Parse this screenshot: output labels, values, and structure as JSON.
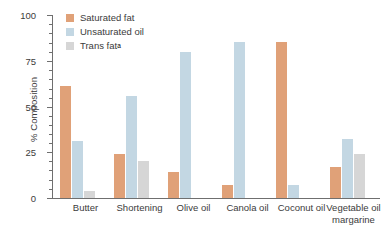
{
  "chart_data": {
    "type": "bar",
    "title": "",
    "xlabel": "",
    "ylabel": "% Composition",
    "ylim": [
      0,
      100
    ],
    "yticks": [
      0,
      25,
      50,
      75,
      100
    ],
    "ytick_labels": [
      "0",
      "25",
      "50",
      "75",
      "100"
    ],
    "minor_ticks_per_interval": 4,
    "grid": false,
    "legend_position": "top-left-inside",
    "categories": [
      "Butter",
      "Shortening",
      "Olive oil",
      "Canola oil",
      "Coconut oil",
      "Vegetable oil margarine"
    ],
    "series": [
      {
        "name": "Saturated fat",
        "color": "#e0a178",
        "values": [
          61,
          24,
          14,
          7,
          85,
          17
        ]
      },
      {
        "name": "Unsaturated oil",
        "color": "#c3d7e3",
        "values": [
          31,
          56,
          80,
          85,
          7,
          32
        ]
      },
      {
        "name": "Trans fat",
        "color": "#d6d6d6",
        "values": [
          4,
          20,
          0,
          0,
          0,
          24
        ]
      }
    ],
    "annotations": {
      "trans_fat_footnote_marker": "a"
    }
  },
  "axis": {
    "y_title": "% Composition",
    "y_tick_0": "0",
    "y_tick_25": "25",
    "y_tick_50": "50",
    "y_tick_75": "75",
    "y_tick_100": "100"
  },
  "legend": {
    "items": [
      {
        "label": "Saturated fat",
        "color": "#e0a178",
        "marker": ""
      },
      {
        "label": "Unsaturated oil",
        "color": "#c3d7e3",
        "marker": ""
      },
      {
        "label": "Trans fat",
        "color": "#d6d6d6",
        "marker": "a"
      }
    ]
  },
  "categories": {
    "c0_line1": "Butter",
    "c0_line2": "",
    "c1_line1": "Shortening",
    "c1_line2": "",
    "c2_line1": "Olive oil",
    "c2_line2": "",
    "c3_line1": "Canola oil",
    "c3_line2": "",
    "c4_line1": "Coconut oil",
    "c4_line2": "",
    "c5_line1": "Vegetable oil",
    "c5_line2": "margarine"
  }
}
